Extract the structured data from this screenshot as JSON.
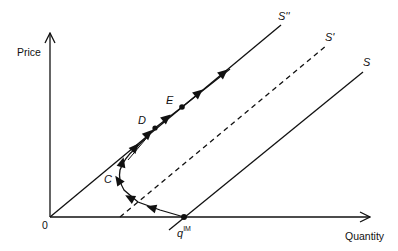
{
  "diagram": {
    "type": "supply-adjustment-path",
    "axes": {
      "y_label": "Price",
      "x_label": "Quantity",
      "origin_label": "0"
    },
    "curves": [
      {
        "id": "S_double_prime",
        "label": "S''",
        "style": "solid",
        "description": "supply curve through origin"
      },
      {
        "id": "S_prime",
        "label": "S'",
        "style": "dashed",
        "description": "intermediate shifted supply curve"
      },
      {
        "id": "S",
        "label": "S",
        "style": "solid",
        "description": "original supply curve crossing quantity axis at qIM"
      }
    ],
    "points": [
      {
        "id": "qIM",
        "label_base": "q",
        "label_sup": "IM",
        "location": "on quantity axis where S crosses"
      },
      {
        "id": "C",
        "label": "C",
        "location": "turning point of path"
      },
      {
        "id": "D",
        "label": "D",
        "location": "on S'' curve"
      },
      {
        "id": "E",
        "label": "E",
        "location": "on S'' curve above D"
      }
    ],
    "path": {
      "description": "arrowed adjustment path from qIM moving up-left to C, then converging onto S'' and continuing up through D and E",
      "arrow_count": 10
    },
    "colors": {
      "ink": "#111111",
      "background": "#ffffff"
    }
  }
}
